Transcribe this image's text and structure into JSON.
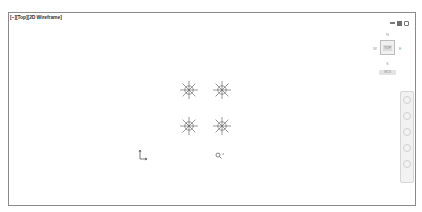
{
  "viewport": {
    "label": "[−][Top][2D Wireframe]",
    "visual_style": "2D Wireframe",
    "view": "Top"
  },
  "window_controls": {
    "minimize_icon": "minimize-icon",
    "maximize_icon": "maximize-icon",
    "close_icon": "close-icon"
  },
  "viewcube": {
    "north": "N",
    "south": "S",
    "west": "W",
    "east": "E",
    "face": "TOP",
    "wcs_label": "WCS"
  },
  "navbar": {
    "tools": [
      "steering-wheel",
      "pan",
      "zoom",
      "orbit",
      "showmotion"
    ]
  },
  "drawing": {
    "symbols": [
      {
        "name": "sunburst-symbol",
        "x": 186,
        "y": 81
      },
      {
        "name": "sunburst-symbol",
        "x": 219,
        "y": 81
      },
      {
        "name": "sunburst-symbol",
        "x": 186,
        "y": 117
      },
      {
        "name": "sunburst-symbol",
        "x": 219,
        "y": 117
      }
    ],
    "ucs_icon": "ucs-icon",
    "cursor_icon": "pickbox-cursor-icon"
  },
  "colors": {
    "frame": "#8a8a8a",
    "geometry": "#555555",
    "background": "#ffffff"
  }
}
